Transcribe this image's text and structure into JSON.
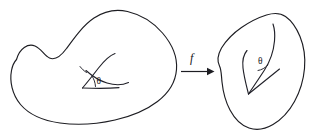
{
  "figure": {
    "background_color": "#ffffff",
    "ink_color": "#1d1d22",
    "width": 310,
    "height": 140
  },
  "domain_region": {
    "name": "source-domain-blob",
    "description": "kidney-shaped closed region on the left",
    "angle_label": "θ"
  },
  "codomain_region": {
    "name": "target-domain-blob",
    "description": "leaf-shaped closed region on the right",
    "angle_label": "θ"
  },
  "map_arrow": {
    "label": "f",
    "description": "horizontal arrow pointing right from left region to right region"
  }
}
